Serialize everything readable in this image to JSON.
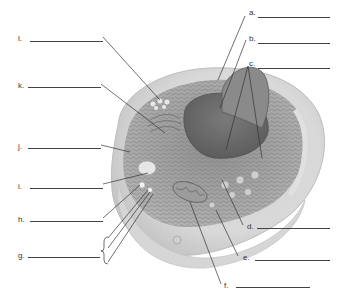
{
  "figure": {
    "labels": [
      {
        "id": "a",
        "text": "a.",
        "x": 249,
        "y": 13,
        "line_x1": 258,
        "line_x2": 330
      },
      {
        "id": "b",
        "text": "b.",
        "x": 249,
        "y": 38,
        "line_x1": 258,
        "line_x2": 330
      },
      {
        "id": "c",
        "text": "c.",
        "x": 249,
        "y": 62,
        "line_x1": 258,
        "line_x2": 330
      },
      {
        "id": "d",
        "text": "d.",
        "x": 247,
        "y": 221,
        "line_x1": 257,
        "line_x2": 330
      },
      {
        "id": "e",
        "text": "e.",
        "x": 243,
        "y": 252,
        "line_x1": 255,
        "line_x2": 330
      },
      {
        "id": "f",
        "text": "f.",
        "x": 224,
        "y": 280,
        "line_x1": 236,
        "line_x2": 310
      },
      {
        "id": "l",
        "text": "l.",
        "x": 18,
        "y": 34,
        "line_x1": 30,
        "line_x2": 103
      },
      {
        "id": "k",
        "text": "k.",
        "x": 18,
        "y": 81,
        "line_x1": 28,
        "line_x2": 101
      },
      {
        "id": "j",
        "text": "j.",
        "x": 18,
        "y": 142,
        "line_x1": 28,
        "line_x2": 101
      },
      {
        "id": "i",
        "text": "i.",
        "x": 18,
        "y": 181,
        "line_x1": 30,
        "line_x2": 103
      },
      {
        "id": "h",
        "text": "h.",
        "x": 18,
        "y": 215,
        "line_x1": 30,
        "line_x2": 103
      },
      {
        "id": "g",
        "text": "g.",
        "x": 18,
        "y": 251,
        "line_x1": 28,
        "line_x2": 100
      }
    ],
    "answer_blanks": 12
  }
}
